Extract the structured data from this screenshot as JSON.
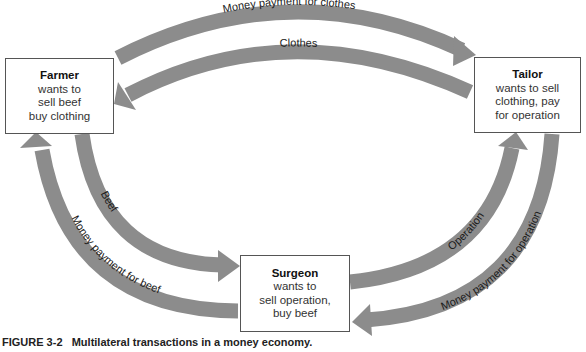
{
  "figure": {
    "caption_number": "FIGURE 3-2",
    "caption_text": "Multilateral transactions in a money economy.",
    "colors": {
      "arrow": "#8c8c8c",
      "box_border": "#555555",
      "background": "#ffffff"
    }
  },
  "nodes": {
    "farmer": {
      "title": "Farmer",
      "lines": [
        "wants to",
        "sell beef",
        "buy clothing"
      ]
    },
    "tailor": {
      "title": "Tailor",
      "lines": [
        "wants to sell",
        "clothing, pay",
        "for operation"
      ]
    },
    "surgeon": {
      "title": "Surgeon",
      "lines": [
        "wants to",
        "sell operation,",
        "buy beef"
      ]
    }
  },
  "flows": [
    {
      "id": "money-for-clothes",
      "label": "Money payment for clothes",
      "from": "Farmer",
      "to": "Tailor"
    },
    {
      "id": "clothes",
      "label": "Clothes",
      "from": "Tailor",
      "to": "Farmer"
    },
    {
      "id": "beef",
      "label": "Beef",
      "from": "Farmer",
      "to": "Surgeon"
    },
    {
      "id": "money-for-beef",
      "label": "Money payment for beef",
      "from": "Surgeon",
      "to": "Farmer"
    },
    {
      "id": "operation",
      "label": "Operation",
      "from": "Surgeon",
      "to": "Tailor"
    },
    {
      "id": "money-for-operation",
      "label": "Money payment for operation",
      "from": "Tailor",
      "to": "Surgeon"
    }
  ]
}
